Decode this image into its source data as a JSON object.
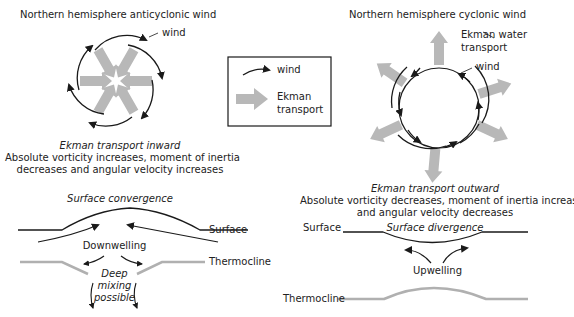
{
  "left": {
    "title": "Northern hemisphere anticyclonic wind",
    "wind_label": "wind",
    "transport_heading": "Ekman transport inward",
    "description_line1": "Absolute vorticity increases, moment of inertia",
    "description_line2": "decreases and angular velocity increases",
    "section_title": "Surface convergence",
    "surface_label": "Surface",
    "process_label": "Downwelling",
    "thermocline_label": "Thermocline",
    "mixing_line1": "Deep",
    "mixing_line2": "mixing",
    "mixing_line3": "possible"
  },
  "legend": {
    "wind_label": "wind",
    "ekman_line1": "Ekman",
    "ekman_line2": "transport"
  },
  "right": {
    "title": "Northern hemisphere cyclonic wind",
    "ekman_label_line1": "Ekman water",
    "ekman_label_line2": "transport",
    "wind_label": "wind",
    "transport_heading": "Ekman transport outward",
    "description_line1": "Absolute vorticity decreases, moment of inertia increases,",
    "description_line2": "and angular velocity decreases",
    "section_title": "Surface divergence",
    "surface_label": "Surface",
    "process_label": "Upwelling",
    "thermocline_label": "Thermocline"
  },
  "colors": {
    "line": "#1a1a1a",
    "ekman_arrow": "#b8b8b8"
  }
}
